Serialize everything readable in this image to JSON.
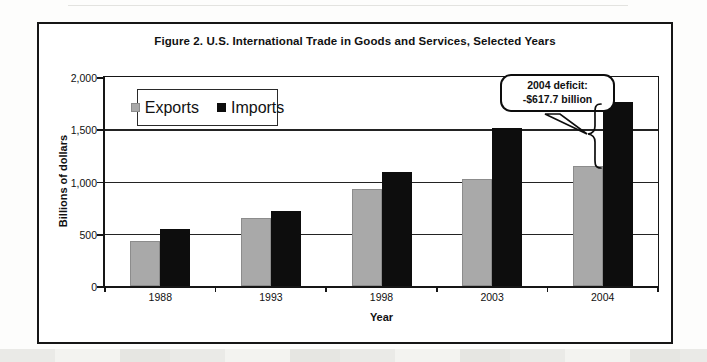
{
  "chart_data": {
    "type": "bar",
    "title": "Figure 2. U.S. International Trade in Goods and Services, Selected Years",
    "categories": [
      "1988",
      "1993",
      "1998",
      "2003",
      "2004"
    ],
    "series": [
      {
        "name": "Exports",
        "color": "#a9a9a9",
        "values": [
          430,
          650,
          930,
          1020,
          1146
        ]
      },
      {
        "name": "Imports",
        "color": "#0d0d0d",
        "values": [
          545,
          715,
          1095,
          1515,
          1764
        ]
      }
    ],
    "xlabel": "Year",
    "ylabel": "Billions of dollars",
    "ylim": [
      0,
      2000
    ],
    "yticks": [
      0,
      500,
      1000,
      1500,
      2000
    ],
    "ytick_labels": [
      "0",
      "500",
      "1,000",
      "1,500",
      "2,000"
    ],
    "grid": true,
    "legend_position": "inside-top-left",
    "annotation": {
      "line1": "2004 deficit:",
      "line2": "-$617.7 billion",
      "points_to": "gap between 2004 Exports and Imports bars"
    }
  }
}
